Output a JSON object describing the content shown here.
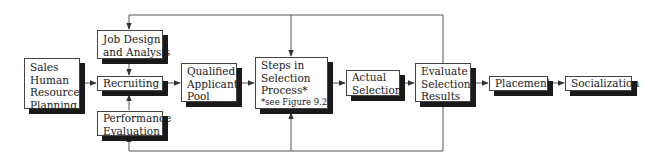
{
  "diagram": {
    "nodes": {
      "sales_hrp": {
        "lines": [
          "Sales",
          "Human",
          "Resource",
          "Planning"
        ]
      },
      "job_design": {
        "lines": [
          "Job Design",
          "and Analysis"
        ]
      },
      "recruiting": {
        "lines": [
          "Recruiting"
        ]
      },
      "performance_eval": {
        "lines": [
          "Performance",
          "Evaluation"
        ]
      },
      "qualified_pool": {
        "lines": [
          "Qualified",
          "Applicant",
          "Pool"
        ]
      },
      "selection_steps": {
        "lines": [
          "Steps in",
          "Selection",
          "Process*"
        ],
        "note": "*see Figure 9.2"
      },
      "actual_selection": {
        "lines": [
          "Actual",
          "Selection"
        ]
      },
      "evaluate_results": {
        "lines": [
          "Evaluate",
          "Selection",
          "Results"
        ]
      },
      "placement": {
        "lines": [
          "Placement"
        ]
      },
      "socialization": {
        "lines": [
          "Socialization"
        ]
      }
    },
    "edges": [
      [
        "sales_hrp",
        "recruiting"
      ],
      [
        "job_design",
        "recruiting"
      ],
      [
        "performance_eval",
        "recruiting"
      ],
      [
        "recruiting",
        "qualified_pool"
      ],
      [
        "qualified_pool",
        "selection_steps"
      ],
      [
        "selection_steps",
        "actual_selection"
      ],
      [
        "actual_selection",
        "evaluate_results"
      ],
      [
        "evaluate_results",
        "placement"
      ],
      [
        "placement",
        "socialization"
      ],
      [
        "evaluate_results",
        "job_design"
      ],
      [
        "evaluate_results",
        "selection_steps"
      ],
      [
        "evaluate_results",
        "performance_eval"
      ]
    ],
    "colors": {
      "line": "#555555",
      "border": "#444444",
      "shadow": "#1a1a1a",
      "background": "#ffffff"
    }
  }
}
